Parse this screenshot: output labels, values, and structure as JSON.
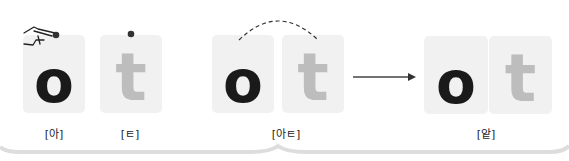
{
  "panels": [
    {
      "id": "a",
      "tiles": [
        {
          "letter": "o",
          "style": "dark"
        }
      ],
      "caption": "[아]",
      "pointer_icon": "pointing-hand-icon"
    },
    {
      "id": "t",
      "tiles": [
        {
          "letter": "t",
          "style": "light"
        }
      ],
      "caption": "[ㅌ]"
    },
    {
      "id": "at",
      "tiles": [
        {
          "letter": "o",
          "style": "dark"
        },
        {
          "letter": "t",
          "style": "light"
        }
      ],
      "caption": "[아ㅌ]",
      "connector": "dashed-arc"
    },
    {
      "id": "result",
      "tiles": [
        {
          "letter": "o",
          "style": "dark"
        },
        {
          "letter": "t",
          "style": "light"
        }
      ],
      "caption": "[앝]"
    }
  ],
  "arrow": "right-arrow-icon",
  "colors": {
    "tile_bg": "#f1f1f1",
    "dark_letter": "#1a1a1a",
    "light_letter": "#bdbdbd",
    "dot": "#333333",
    "frame": "#e2e2e2"
  }
}
